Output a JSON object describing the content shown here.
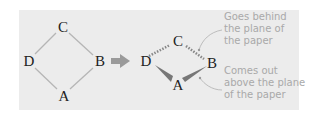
{
  "left_diagram": {
    "atoms": {
      "top": "C",
      "left": "D",
      "right": "B",
      "bottom": "A"
    }
  },
  "right_diagram": {
    "atoms": {
      "top": "C",
      "left": "D",
      "right": "B",
      "bottom": "A"
    }
  },
  "arrow": {
    "icon": "right-arrow",
    "color": "#9a9a9a"
  },
  "annotations": {
    "behind": {
      "line1": "Goes behind",
      "line2": "the plane of",
      "line3": "the paper"
    },
    "above": {
      "line1": "Comes out",
      "line2": "above the plane",
      "line3": "of the paper"
    }
  },
  "colors": {
    "panel": "#ececec",
    "bond": "#b0b0b0",
    "wedge": "#777777",
    "note": "#a9a9a9"
  }
}
